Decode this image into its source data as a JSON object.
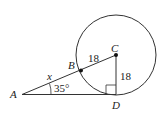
{
  "diagram": {
    "type": "geometry",
    "points": {
      "A": {
        "label": "A",
        "x": 22,
        "y": 94
      },
      "B": {
        "label": "B",
        "x": 81,
        "y": 71
      },
      "C": {
        "label": "C",
        "x": 116,
        "y": 55
      },
      "D": {
        "label": "D",
        "x": 116,
        "y": 95
      }
    },
    "circle": {
      "center": "C",
      "cx": 116,
      "cy": 55,
      "r": 40
    },
    "labels": {
      "segment_AB": "x",
      "segment_BC": "18",
      "segment_CD": "18",
      "angle_A": "35°"
    },
    "right_angle_at": "D",
    "colors": {
      "stroke": "#333333",
      "text": "#222222",
      "background": "#ffffff"
    }
  }
}
